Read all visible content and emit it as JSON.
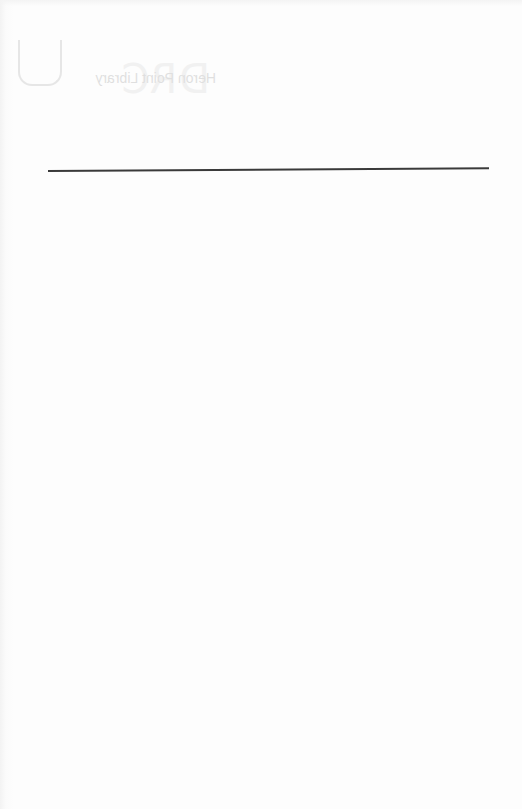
{
  "document": {
    "type": "scanned blank back page",
    "showthrough": {
      "title_text": "Heron Point Library",
      "mirrored": true,
      "ghost_letters": "DRC"
    },
    "rule": {
      "color": "#3a3a3a"
    },
    "background_color": "#fdfdfd"
  }
}
